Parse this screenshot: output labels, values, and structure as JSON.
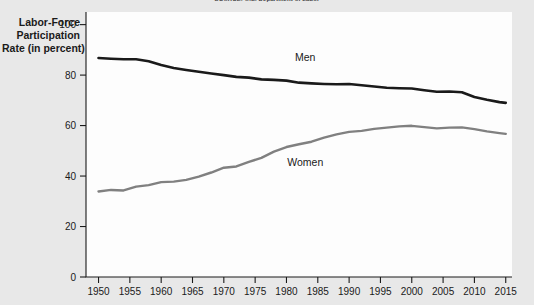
{
  "source_note": "SOURCE: U.S. Department of Labor",
  "y_axis_title": {
    "line1": "Labor-Force",
    "line2": "Participation",
    "line3": "Rate (in percent)"
  },
  "colors": {
    "page_background": "#e8e8e8",
    "plot_background": "#fdfdfd",
    "men_line": "#1a1a1a",
    "women_line": "#808080",
    "axis": "#1a1a1a",
    "text": "#1a1a1a"
  },
  "chart_data": {
    "type": "line",
    "title": "",
    "subtitle": "",
    "xlabel": "",
    "ylabel": "Labor-Force Participation Rate (in percent)",
    "xlim": [
      1948,
      2016
    ],
    "ylim": [
      0,
      105
    ],
    "grid": false,
    "legend_position": "inline-annotation",
    "xticks": [
      1950,
      1955,
      1960,
      1965,
      1970,
      1975,
      1980,
      1985,
      1990,
      1995,
      2000,
      2005,
      2010,
      2015
    ],
    "xtick_labels": [
      "1950",
      "1955",
      "1960",
      "1965",
      "1970",
      "1975",
      "1980",
      "1985",
      "1990",
      "1995",
      "2000",
      "2005",
      "2010",
      "2015"
    ],
    "yticks": [
      0,
      20,
      40,
      60,
      80,
      100
    ],
    "ytick_labels": [
      "0",
      "20",
      "40",
      "60",
      "80",
      "100"
    ],
    "annotations": [
      {
        "text": "Men",
        "x": 1983,
        "y": 85.5
      },
      {
        "text": "Women",
        "x": 1983,
        "y": 44.0
      }
    ],
    "x": [
      1950,
      1952,
      1954,
      1956,
      1958,
      1960,
      1962,
      1964,
      1966,
      1968,
      1970,
      1972,
      1974,
      1976,
      1978,
      1980,
      1982,
      1984,
      1986,
      1988,
      1990,
      1992,
      1994,
      1996,
      1998,
      2000,
      2002,
      2004,
      2006,
      2008,
      2010,
      2012,
      2014,
      2015
    ],
    "series": [
      {
        "name": "Men",
        "color": "#1a1a1a",
        "values": [
          86.8,
          86.5,
          86.3,
          86.3,
          85.5,
          84.0,
          82.8,
          82.0,
          81.3,
          80.6,
          80.0,
          79.3,
          79.0,
          78.3,
          78.1,
          77.8,
          77.0,
          76.7,
          76.5,
          76.4,
          76.5,
          76.0,
          75.5,
          75.0,
          74.8,
          74.7,
          74.0,
          73.4,
          73.5,
          73.2,
          71.3,
          70.2,
          69.3,
          69.0
        ]
      },
      {
        "name": "Women",
        "color": "#808080",
        "values": [
          33.9,
          34.5,
          34.3,
          35.8,
          36.4,
          37.6,
          37.8,
          38.5,
          39.8,
          41.4,
          43.3,
          43.8,
          45.6,
          47.2,
          49.7,
          51.5,
          52.6,
          53.6,
          55.2,
          56.5,
          57.5,
          57.9,
          58.7,
          59.2,
          59.7,
          59.9,
          59.4,
          58.9,
          59.2,
          59.3,
          58.6,
          57.7,
          57.0,
          56.7
        ]
      }
    ]
  }
}
